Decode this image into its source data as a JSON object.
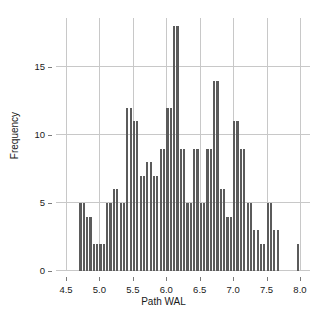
{
  "chart_data": {
    "type": "bar",
    "title": "",
    "subtitle": "",
    "xlabel": "Path WAL",
    "ylabel": "Frequency",
    "xlim": [
      4.35,
      8.15
    ],
    "ylim": [
      0,
      18.6
    ],
    "bin_width": 0.05,
    "grid": true,
    "legend": null,
    "bar_color": "#5b5b5b",
    "grid_color": "#c8c8c8",
    "x_ticks": [
      4.5,
      5.0,
      5.5,
      6.0,
      6.5,
      7.0,
      7.5,
      8.0
    ],
    "x_tick_labels": [
      "4.5",
      "5.0",
      "5.5",
      "6.0",
      "6.5",
      "7.0",
      "7.5",
      "8.0"
    ],
    "y_ticks": [
      0,
      5,
      10,
      15
    ],
    "y_tick_labels": [
      "0",
      "5",
      "10",
      "15"
    ],
    "x": [
      4.7,
      4.75,
      4.8,
      4.85,
      4.9,
      4.95,
      5.0,
      5.05,
      5.1,
      5.15,
      5.2,
      5.25,
      5.3,
      5.35,
      5.4,
      5.45,
      5.5,
      5.55,
      5.6,
      5.65,
      5.7,
      5.75,
      5.8,
      5.85,
      5.9,
      5.95,
      6.0,
      6.05,
      6.1,
      6.15,
      6.2,
      6.25,
      6.3,
      6.35,
      6.4,
      6.45,
      6.5,
      6.55,
      6.6,
      6.65,
      6.7,
      6.75,
      6.8,
      6.85,
      6.9,
      6.95,
      7.0,
      7.05,
      7.1,
      7.15,
      7.2,
      7.25,
      7.3,
      7.35,
      7.4,
      7.45,
      7.5,
      7.55,
      7.6,
      7.65,
      7.95
    ],
    "values": [
      5,
      5,
      4,
      4,
      2,
      2,
      2,
      2,
      5,
      5,
      6,
      6,
      5,
      5,
      12,
      12,
      11,
      11,
      7,
      7,
      8,
      8,
      7,
      7,
      9,
      9,
      12,
      12,
      18,
      18,
      9,
      9,
      5,
      5,
      9,
      9,
      5,
      5,
      9,
      9,
      14,
      14,
      6,
      6,
      4,
      4,
      11,
      11,
      9,
      9,
      5,
      5,
      3,
      3,
      2,
      2,
      5,
      5,
      3,
      3,
      2
    ],
    "categories": [
      "4.70",
      "4.75",
      "4.80",
      "4.85",
      "4.90",
      "4.95",
      "5.00",
      "5.05",
      "5.10",
      "5.15",
      "5.20",
      "5.25",
      "5.30",
      "5.35",
      "5.40",
      "5.45",
      "5.50",
      "5.55",
      "5.60",
      "5.65",
      "5.70",
      "5.75",
      "5.80",
      "5.85",
      "5.90",
      "5.95",
      "6.00",
      "6.05",
      "6.10",
      "6.15",
      "6.20",
      "6.25",
      "6.30",
      "6.35",
      "6.40",
      "6.45",
      "6.50",
      "6.55",
      "6.60",
      "6.65",
      "6.70",
      "6.75",
      "6.80",
      "6.85",
      "6.90",
      "6.95",
      "7.00",
      "7.05",
      "7.10",
      "7.15",
      "7.20",
      "7.25",
      "7.30",
      "7.35",
      "7.40",
      "7.45",
      "7.50",
      "7.55",
      "7.60",
      "7.65",
      "7.95"
    ]
  },
  "axes": {
    "x_label": "Path WAL",
    "y_label": "Frequency"
  }
}
